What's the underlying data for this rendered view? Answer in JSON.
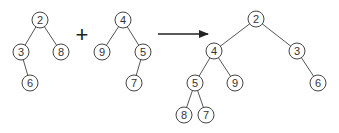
{
  "diagram": {
    "colors": {
      "stroke": "#444444",
      "edge": "#555555",
      "text": "#333333",
      "arrow": "#222222"
    },
    "operator_plus": "+",
    "trees": [
      {
        "id": "tree1",
        "nodes": [
          {
            "id": "a2",
            "label": "2",
            "x": 40,
            "y": 20
          },
          {
            "id": "a3",
            "label": "3",
            "x": 21,
            "y": 52
          },
          {
            "id": "a8",
            "label": "8",
            "x": 61,
            "y": 52
          },
          {
            "id": "a6",
            "label": "6",
            "x": 30,
            "y": 83
          }
        ],
        "edges": [
          [
            "a2",
            "a3"
          ],
          [
            "a2",
            "a8"
          ],
          [
            "a3",
            "a6"
          ]
        ]
      },
      {
        "id": "tree2",
        "nodes": [
          {
            "id": "b4",
            "label": "4",
            "x": 123,
            "y": 20
          },
          {
            "id": "b9",
            "label": "9",
            "x": 102,
            "y": 52
          },
          {
            "id": "b5",
            "label": "5",
            "x": 143,
            "y": 52
          },
          {
            "id": "b7",
            "label": "7",
            "x": 134,
            "y": 83
          }
        ],
        "edges": [
          [
            "b4",
            "b9"
          ],
          [
            "b4",
            "b5"
          ],
          [
            "b5",
            "b7"
          ]
        ]
      },
      {
        "id": "result",
        "nodes": [
          {
            "id": "c2",
            "label": "2",
            "x": 256,
            "y": 19
          },
          {
            "id": "c4",
            "label": "4",
            "x": 214,
            "y": 51
          },
          {
            "id": "c3",
            "label": "3",
            "x": 297,
            "y": 51
          },
          {
            "id": "c5",
            "label": "5",
            "x": 195,
            "y": 83
          },
          {
            "id": "c9",
            "label": "9",
            "x": 235,
            "y": 83
          },
          {
            "id": "c6",
            "label": "6",
            "x": 318,
            "y": 83
          },
          {
            "id": "c8",
            "label": "8",
            "x": 184,
            "y": 115
          },
          {
            "id": "c7",
            "label": "7",
            "x": 206,
            "y": 115
          }
        ],
        "edges": [
          [
            "c2",
            "c4"
          ],
          [
            "c2",
            "c3"
          ],
          [
            "c4",
            "c5"
          ],
          [
            "c4",
            "c9"
          ],
          [
            "c3",
            "c6"
          ],
          [
            "c5",
            "c8"
          ],
          [
            "c5",
            "c7"
          ]
        ]
      }
    ],
    "plus_position": {
      "x": 82,
      "y": 42
    },
    "arrow": {
      "x1": 158,
      "y1": 34,
      "x2": 208,
      "y2": 34
    },
    "node_radius": 8
  }
}
